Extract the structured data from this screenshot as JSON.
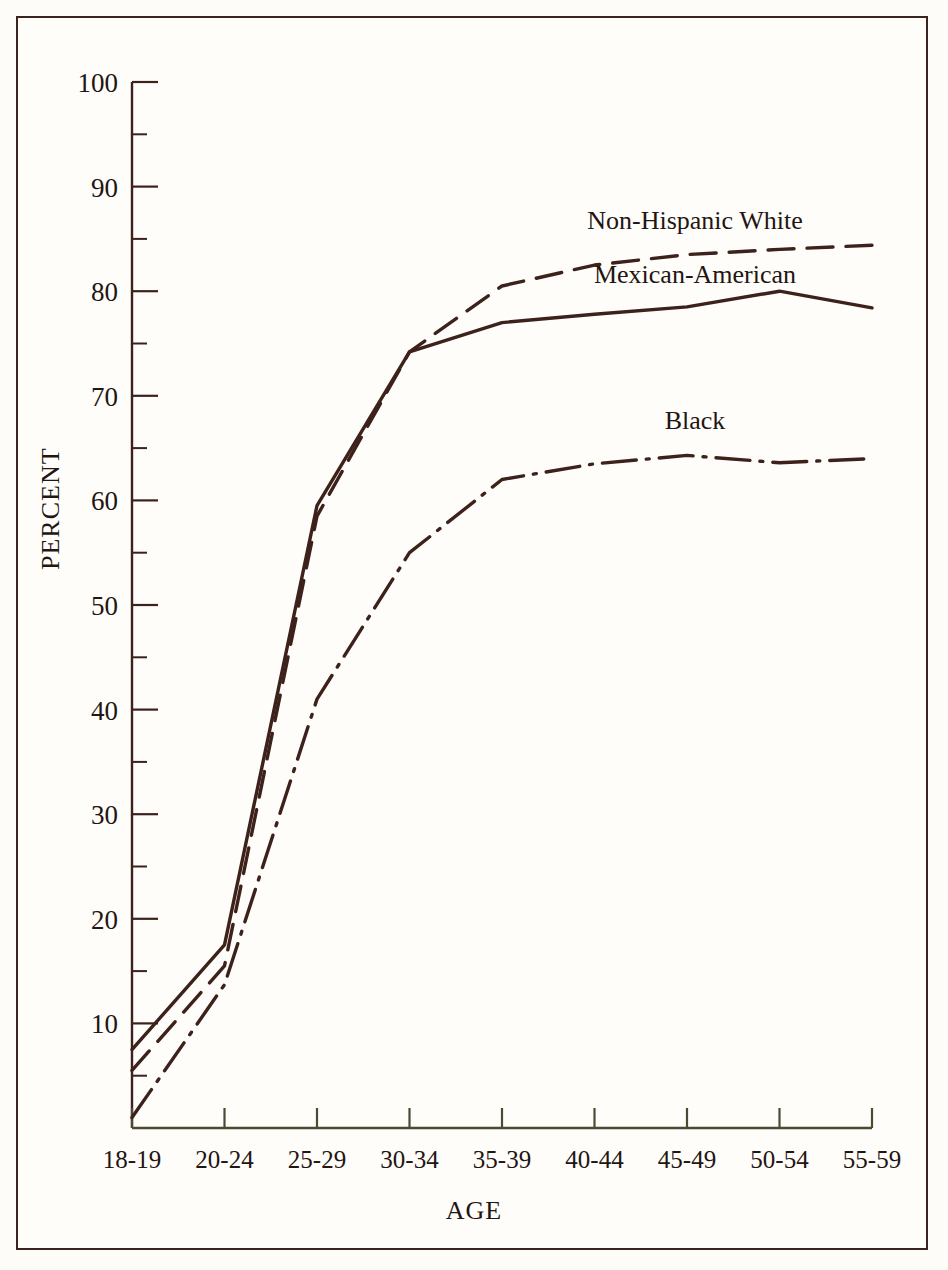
{
  "figure": {
    "background_color": "#fdfcf9",
    "frame_color": "#3a241f",
    "line_color": "#3d211b"
  },
  "chart_data": {
    "type": "line",
    "title": "",
    "xlabel": "AGE",
    "ylabel": "PERCENT",
    "categories": [
      "18-19",
      "20-24",
      "25-29",
      "30-34",
      "35-39",
      "40-44",
      "45-49",
      "50-54",
      "55-59"
    ],
    "x_tick_labels": [
      "18-19",
      "20-24",
      "25-29",
      "30-34",
      "35-39",
      "40-44",
      "45-49",
      "50-54",
      "55-59"
    ],
    "y_tick_labels": [
      "10",
      "20",
      "30",
      "40",
      "50",
      "60",
      "70",
      "80",
      "90",
      "100"
    ],
    "y_major_ticks": [
      10,
      20,
      30,
      40,
      50,
      60,
      70,
      80,
      90,
      100
    ],
    "y_minor_ticks": [
      5,
      15,
      25,
      35,
      45,
      55,
      65,
      75,
      85,
      95
    ],
    "ylim": [
      0,
      100
    ],
    "grid": false,
    "legend_position": "inline-annotations",
    "series": [
      {
        "name": "Non-Hispanic White",
        "line_style": "dashed",
        "label_x_category": "45-49",
        "values": [
          5.5,
          15.5,
          58.5,
          74.2,
          80.5,
          82.5,
          83.5,
          84.0,
          84.4
        ]
      },
      {
        "name": "Mexican-American",
        "line_style": "solid",
        "label_x_category": "45-49",
        "values": [
          7.5,
          17.5,
          59.5,
          74.2,
          77.0,
          77.8,
          78.5,
          80.0,
          78.4
        ]
      },
      {
        "name": "Black",
        "line_style": "dash-dot",
        "label_x_category": "45-49",
        "values": [
          1.0,
          13.7,
          41.0,
          55.0,
          62.0,
          63.5,
          64.3,
          63.6,
          64.0
        ]
      }
    ],
    "annotations": [
      {
        "text": "Non-Hispanic White",
        "series": "Non-Hispanic White"
      },
      {
        "text": "Mexican-American",
        "series": "Mexican-American"
      },
      {
        "text": "Black",
        "series": "Black"
      }
    ]
  }
}
